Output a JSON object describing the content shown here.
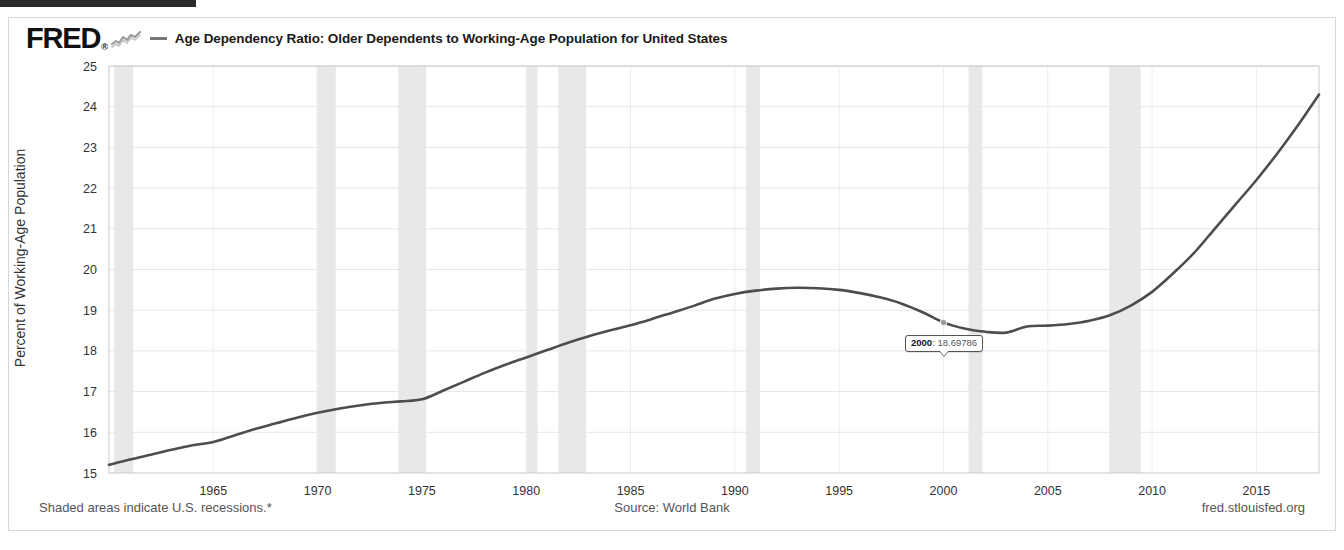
{
  "header": {
    "logo_text": "FRED",
    "logo_reg": "®",
    "logo_spark_icon": "sparkline-icon",
    "legend_swatch_icon": "legend-line-swatch",
    "title": "Age Dependency Ratio: Older Dependents to Working-Age Population for United States"
  },
  "tooltip": {
    "year": "2000",
    "separator": ": ",
    "value": "18.69786"
  },
  "footer": {
    "recession_note": "Shaded areas indicate U.S. recessions.*",
    "source": "Source: World Bank",
    "site": "fred.stlouisfed.org"
  },
  "chart_data": {
    "type": "line",
    "title": "Age Dependency Ratio: Older Dependents to Working-Age Population for United States",
    "xlabel": "",
    "ylabel": "Percent of Working-Age Population",
    "xlim": [
      1960,
      2018
    ],
    "ylim": [
      15,
      25
    ],
    "grid": true,
    "legend_position": "top",
    "line_color": "#4d4d4d",
    "recession_band_color": "#e8e8e8",
    "x_ticks": [
      1965,
      1970,
      1975,
      1980,
      1985,
      1990,
      1995,
      2000,
      2005,
      2010,
      2015
    ],
    "y_ticks": [
      15,
      16,
      17,
      18,
      19,
      20,
      21,
      22,
      23,
      24,
      25
    ],
    "series": [
      {
        "name": "Age Dependency Ratio: Older Dependents to Working-Age Population for United States",
        "x": [
          1960,
          1961,
          1962,
          1963,
          1964,
          1965,
          1966,
          1967,
          1968,
          1969,
          1970,
          1971,
          1972,
          1973,
          1974,
          1975,
          1976,
          1977,
          1978,
          1979,
          1980,
          1981,
          1982,
          1983,
          1984,
          1985,
          1986,
          1987,
          1988,
          1989,
          1990,
          1991,
          1992,
          1993,
          1994,
          1995,
          1996,
          1997,
          1998,
          1999,
          2000,
          2001,
          2002,
          2003,
          2004,
          2005,
          2006,
          2007,
          2008,
          2009,
          2010,
          2011,
          2012,
          2013,
          2014,
          2015,
          2016,
          2017,
          2018
        ],
        "values": [
          15.2,
          15.33,
          15.45,
          15.57,
          15.68,
          15.76,
          15.92,
          16.08,
          16.22,
          16.36,
          16.48,
          16.58,
          16.66,
          16.72,
          16.76,
          16.81,
          17.02,
          17.24,
          17.46,
          17.66,
          17.84,
          18.02,
          18.2,
          18.36,
          18.5,
          18.63,
          18.78,
          18.94,
          19.1,
          19.28,
          19.4,
          19.48,
          19.53,
          19.55,
          19.54,
          19.5,
          19.42,
          19.31,
          19.16,
          18.95,
          18.7,
          18.55,
          18.47,
          18.45,
          18.6,
          18.62,
          18.66,
          18.74,
          18.88,
          19.12,
          19.45,
          19.9,
          20.4,
          21.0,
          21.6,
          22.2,
          22.85,
          23.55,
          24.3
        ]
      }
    ],
    "recession_bands": [
      {
        "start": 1960.25,
        "end": 1961.16
      },
      {
        "start": 1969.95,
        "end": 1970.87
      },
      {
        "start": 1973.87,
        "end": 1975.2
      },
      {
        "start": 1980.04,
        "end": 1980.54
      },
      {
        "start": 1981.54,
        "end": 1982.87
      },
      {
        "start": 1990.54,
        "end": 1991.2
      },
      {
        "start": 2001.2,
        "end": 2001.87
      },
      {
        "start": 2007.95,
        "end": 2009.45
      }
    ],
    "highlighted_point": {
      "x": 2000,
      "y": 18.69786,
      "label": "2000: 18.69786"
    }
  }
}
